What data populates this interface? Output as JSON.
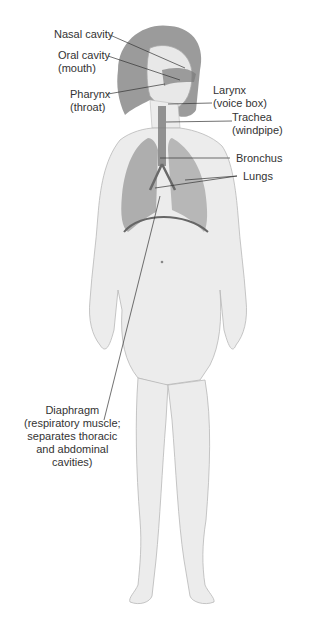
{
  "diagram": {
    "labels": {
      "nasal_cavity": [
        "Nasal cavity"
      ],
      "oral_cavity": [
        "Oral cavity",
        "(mouth)"
      ],
      "pharynx": [
        "Pharynx",
        "(throat)"
      ],
      "larynx": [
        "Larynx",
        "(voice box)"
      ],
      "trachea": [
        "Trachea",
        "(windpipe)"
      ],
      "bronchus": [
        "Bronchus"
      ],
      "lungs": [
        "Lungs"
      ],
      "diaphragm": [
        "Diaphragm",
        "(respiratory muscle;",
        "separates thoracic",
        "and abdominal",
        "cavities)"
      ]
    },
    "colors": {
      "skin": "#ececec",
      "outline": "#b8b8b8",
      "hair": "#8a8a8a",
      "lungs": "#9a9a9a",
      "airway": "#7a7a7a",
      "leader_line": "#333333",
      "text": "#333333"
    }
  }
}
